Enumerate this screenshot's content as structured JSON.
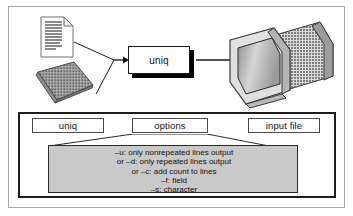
{
  "figure": {
    "colors": {
      "outer_border": "#a9a9a9",
      "panel_border": "#1c1c1c",
      "detail_background": "#c9c9c9",
      "detail_border": "#2b2b2b",
      "shadow": "#000000",
      "line": "#1a1a1a",
      "page_background": "#ffffff"
    }
  },
  "flow": {
    "input_document": {
      "icon": "document-icon",
      "label": ""
    },
    "input_keyboard": {
      "icon": "keyboard-icon",
      "label": ""
    },
    "process": {
      "label": "uniq"
    },
    "output_monitor": {
      "icon": "monitor-icon",
      "label": ""
    },
    "arrow_in": "arrow-right-icon",
    "arrow_out": "arrow-right-icon"
  },
  "syntax": {
    "tokens": [
      {
        "name": "command",
        "label": "uniq"
      },
      {
        "name": "options",
        "label": "options"
      },
      {
        "name": "input-file",
        "label": "input file"
      }
    ],
    "options_detail": [
      "–u: only nonrepeated lines output",
      "or –d: only repeated lines output",
      "or –c: add count to lines",
      "–f: field",
      "–s: character"
    ]
  }
}
